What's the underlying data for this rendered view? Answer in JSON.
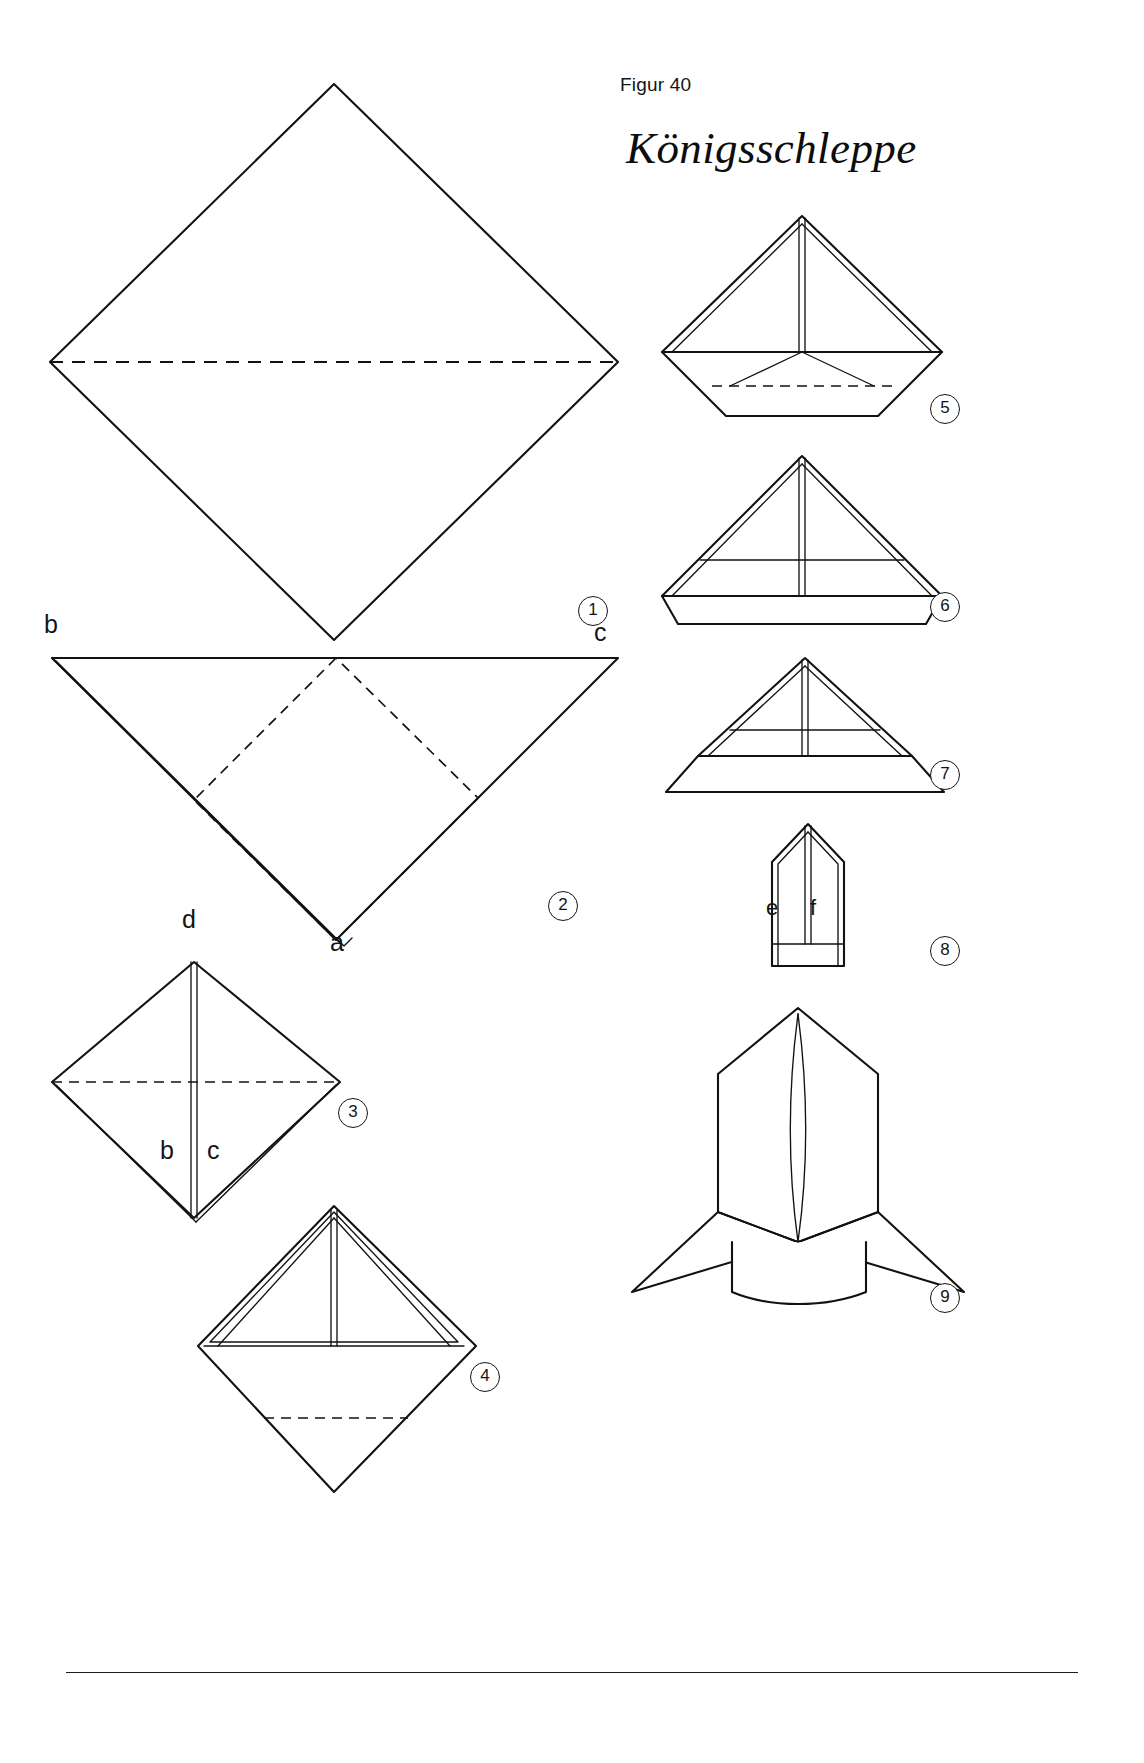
{
  "page": {
    "figure_label": "Figur 40",
    "title": "Königsschleppe",
    "background_color": "#ffffff",
    "ink_color": "#121212"
  },
  "steps": [
    {
      "number": "1",
      "name": "open-square-with-horizontal-crease"
    },
    {
      "number": "2",
      "name": "triangle-with-square-crease-lines"
    },
    {
      "number": "3",
      "name": "diamond-with-center-line"
    },
    {
      "number": "4",
      "name": "diamond-with-inner-triangle"
    },
    {
      "number": "5",
      "name": "triangle-with-folded-lower-band"
    },
    {
      "number": "6",
      "name": "triangle-with-wide-band"
    },
    {
      "number": "7",
      "name": "flattened-triangle-with-band"
    },
    {
      "number": "8",
      "name": "narrow-upright-body"
    },
    {
      "number": "9",
      "name": "finished-koenigsschleppe"
    }
  ],
  "point_labels": {
    "step2": {
      "b": "b",
      "c": "c",
      "a": "a"
    },
    "step3": {
      "d": "d",
      "b": "b",
      "c": "c"
    },
    "step8": {
      "e": "e",
      "f": "f"
    }
  }
}
